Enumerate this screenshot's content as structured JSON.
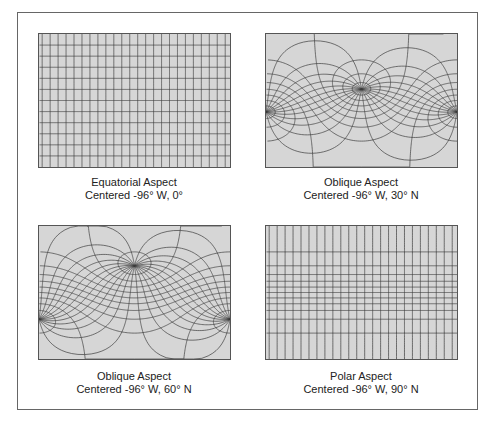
{
  "figure": {
    "colors": {
      "ocean": "#d6d6d6",
      "land": "#ffffff",
      "graticule": "#3a3a3a",
      "frame": "#666666",
      "text": "#222222"
    },
    "graticule_step_deg": 15,
    "panels": [
      {
        "id": "equatorial",
        "title": "Equatorial Aspect",
        "subtitle": "Centered -96° W, 0°",
        "center_lon": -96,
        "center_lat": 0,
        "left": 38,
        "top": 33,
        "caption_left": 19,
        "caption_top": 176
      },
      {
        "id": "oblique-30",
        "title": "Oblique Aspect",
        "subtitle": "Centered -96° W, 30° N",
        "center_lon": -96,
        "center_lat": 30,
        "left": 265,
        "top": 33,
        "caption_left": 246,
        "caption_top": 176
      },
      {
        "id": "oblique-60",
        "title": "Oblique Aspect",
        "subtitle": "Centered -96° W, 60° N",
        "center_lon": -96,
        "center_lat": 60,
        "left": 38,
        "top": 225,
        "caption_left": 19,
        "caption_top": 370
      },
      {
        "id": "polar",
        "title": "Polar Aspect",
        "subtitle": "Centered -96° W, 90° N",
        "center_lon": -96,
        "center_lat": 90,
        "left": 265,
        "top": 225,
        "caption_left": 246,
        "caption_top": 370
      }
    ]
  }
}
